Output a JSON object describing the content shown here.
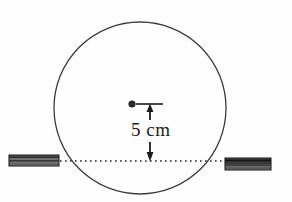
{
  "figure": {
    "type": "physics-diagram",
    "background_color": "#fefefe"
  },
  "circle": {
    "name": "hoop",
    "center_x": 140,
    "center_y": 108,
    "radius": 86,
    "stroke_color": "#3b3b3b",
    "stroke_width": 1.3,
    "fill": "none"
  },
  "center_marker": {
    "name": "center-point",
    "x": 132,
    "y": 104,
    "radius": 3.6,
    "color": "#2b2b2b"
  },
  "reference_line": {
    "name": "support-level-line",
    "y": 161,
    "x_start": 60,
    "x_end": 233,
    "style": "dotted",
    "color": "#262626"
  },
  "dimension": {
    "label": "5 cm",
    "value": 5,
    "unit": "cm",
    "arrow_x": 150,
    "top_y": 104,
    "bottom_y": 161,
    "tick_x_start": 136,
    "tick_x_end": 163,
    "color": "#1c1c1c"
  },
  "supports": [
    {
      "name": "left-support-block",
      "side": "left",
      "x": 9,
      "y": 155,
      "width": 50,
      "height": 11,
      "border_color": "#2a2a2a",
      "fill_color": "#4a4a4a"
    },
    {
      "name": "right-support-block",
      "side": "right",
      "x": 225,
      "y": 158,
      "width": 46,
      "height": 12,
      "border_color": "#2a2a2a",
      "fill_color": "#4a4a4a"
    }
  ],
  "colors": {
    "ink": "#2b2b2b",
    "line": "#3b3b3b",
    "paper": "#fefefe"
  }
}
